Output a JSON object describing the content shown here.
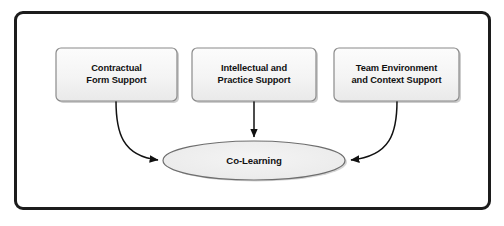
{
  "figure": {
    "type": "concept-diagram",
    "frame": {
      "style": "rounded-rectangle",
      "border_color": "#1c1c1c"
    },
    "nodes": [
      {
        "id": "contractual-form-support",
        "shape": "rounded-rectangle",
        "line1": "Contractual",
        "line2": "Form Support",
        "fill": "#f3f3f3",
        "border": "#8a8a8a"
      },
      {
        "id": "intellectual-practice-support",
        "shape": "rounded-rectangle",
        "line1": "Intellectual and",
        "line2": "Practice Support",
        "fill": "#f3f3f3",
        "border": "#8a8a8a"
      },
      {
        "id": "team-environment-context-support",
        "shape": "rounded-rectangle",
        "line1": "Team Environment",
        "line2": "and Context Support",
        "fill": "#f3f3f3",
        "border": "#8a8a8a"
      }
    ],
    "hub": {
      "id": "co-learning",
      "shape": "ellipse",
      "label": "Co-Learning",
      "fill": "#ececec",
      "border": "#6e6e6e"
    },
    "connectors": [
      {
        "id": "contractual-to-co-learning",
        "from": "contractual-form-support",
        "to": "co-learning",
        "style": "curved-arrow",
        "direction": "down-right",
        "color": "#111111"
      },
      {
        "id": "intellectual-to-co-learning",
        "from": "intellectual-practice-support",
        "to": "co-learning",
        "style": "straight-arrow",
        "direction": "down",
        "color": "#111111"
      },
      {
        "id": "team-environment-to-co-learning",
        "from": "team-environment-context-support",
        "to": "co-learning",
        "style": "curved-arrow",
        "direction": "down-left",
        "color": "#111111"
      }
    ]
  }
}
